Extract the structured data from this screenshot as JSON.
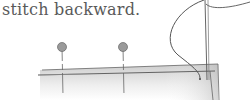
{
  "caption": "stitch backward.",
  "illustration": {
    "subject": "hand sewing backstitch on folded fabric edge",
    "elements": [
      "pin-left",
      "pin-right",
      "needle",
      "thread",
      "fabric-fold"
    ],
    "colors": {
      "pin_head": "#9a9a9a",
      "line": "#555555",
      "fabric_shade": "#cfcfcf"
    }
  }
}
